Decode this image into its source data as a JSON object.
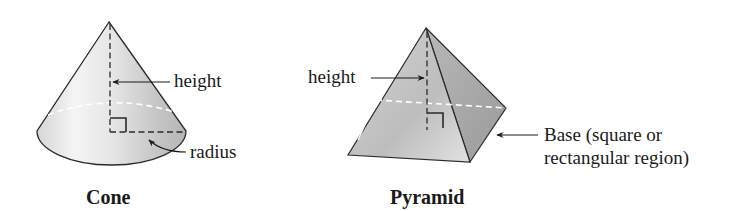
{
  "figure": {
    "cone": {
      "title": "Cone",
      "labels": {
        "height": "height",
        "radius": "radius"
      }
    },
    "pyramid": {
      "title": "Pyramid",
      "labels": {
        "height": "height",
        "base_line1": "Base (square or",
        "base_line2": "rectangular region)"
      }
    }
  }
}
